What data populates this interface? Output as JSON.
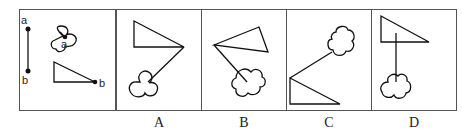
{
  "puzzle": {
    "given_panel": {
      "point_labels": [
        "a",
        "b"
      ],
      "shapes": [
        "line-segment-a-b",
        "cloud-with-point-a",
        "right-triangle-with-point-b"
      ]
    },
    "options": [
      {
        "label": "A"
      },
      {
        "label": "B"
      },
      {
        "label": "C"
      },
      {
        "label": "D"
      }
    ]
  }
}
